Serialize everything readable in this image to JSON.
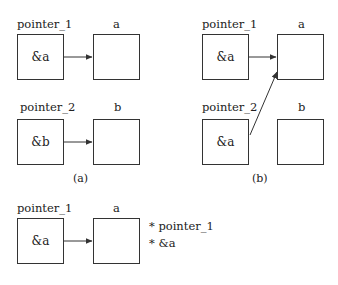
{
  "panel_a": {
    "row1": {
      "pointer_label": "pointer_1",
      "pointer_value": "&a",
      "target_label": "a"
    },
    "row2": {
      "pointer_label": "pointer_2",
      "pointer_value": "&b",
      "target_label": "b"
    },
    "caption": "(a)"
  },
  "panel_b": {
    "row1": {
      "pointer_label": "pointer_1",
      "pointer_value": "&a",
      "target_label": "a"
    },
    "row2": {
      "pointer_label": "pointer_2",
      "pointer_value": "&a",
      "target_label": "b"
    },
    "caption": "(b)"
  },
  "panel_c": {
    "pointer_label": "pointer_1",
    "pointer_value": "&a",
    "target_label": "a",
    "annotations": [
      "* pointer_1",
      "* &a"
    ]
  },
  "colors": {
    "stroke": "#333333",
    "background": "#ffffff"
  }
}
